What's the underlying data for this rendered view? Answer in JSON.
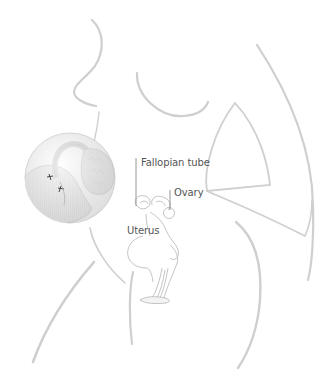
{
  "diagram": {
    "labels": {
      "fallopian_tube": "Fallopian tube",
      "ovary": "Ovary",
      "uterus": "Uterus"
    },
    "colors": {
      "outline": "#cfcfcf",
      "organ_line": "#b5b5b5",
      "inset_fill": "#e6e6e6",
      "label_text": "#555555",
      "leader_line": "#8a8a8a"
    }
  }
}
